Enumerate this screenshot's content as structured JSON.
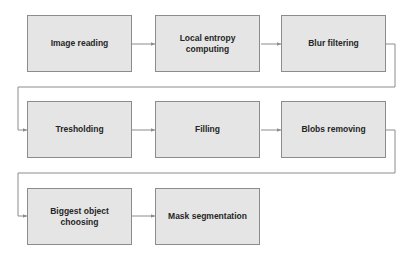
{
  "diagram": {
    "type": "flowchart",
    "layout": "three rows, snaking left-to-right with return connectors",
    "colors": {
      "box_fill": "#e5e5e5",
      "box_border": "#8c8c8c",
      "text": "#262626",
      "connector": "#8c8c8c"
    },
    "steps": [
      {
        "label": "Image reading"
      },
      {
        "label": "Local entropy computing"
      },
      {
        "label": "Blur filtering"
      },
      {
        "label": "Tresholding"
      },
      {
        "label": "Filling"
      },
      {
        "label": "Blobs removing"
      },
      {
        "label": "Biggest object choosing"
      },
      {
        "label": "Mask segmentation"
      }
    ],
    "edges": [
      {
        "from": "Image reading",
        "to": "Local entropy computing"
      },
      {
        "from": "Local entropy computing",
        "to": "Blur filtering"
      },
      {
        "from": "Blur filtering",
        "to": "Tresholding"
      },
      {
        "from": "Tresholding",
        "to": "Filling"
      },
      {
        "from": "Filling",
        "to": "Blobs removing"
      },
      {
        "from": "Blobs removing",
        "to": "Biggest object choosing"
      },
      {
        "from": "Biggest object choosing",
        "to": "Mask segmentation"
      }
    ]
  }
}
